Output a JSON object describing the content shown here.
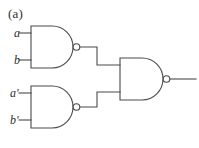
{
  "figure": {
    "panel_label": "(a)",
    "background_color": "#ffffff",
    "line_color": "#4a4a4a",
    "text_color": "#2f2c2a",
    "width": 199,
    "height": 148
  },
  "diagram": {
    "kind": "logic-circuit",
    "gates": [
      {
        "id": "nand-top",
        "type": "NAND",
        "label": "",
        "inputs": [
          "a",
          "b"
        ],
        "body": {
          "x": 31,
          "y": 26,
          "w": 42,
          "h": 42
        },
        "bubble": {
          "cx": 76.5,
          "cy": 47,
          "r": 3.5
        }
      },
      {
        "id": "nand-bottom",
        "type": "NAND",
        "label": "",
        "inputs": [
          "a'",
          "b'"
        ],
        "body": {
          "x": 31,
          "y": 86,
          "w": 42,
          "h": 42
        },
        "bubble": {
          "cx": 76.5,
          "cy": 107,
          "r": 3.5
        }
      },
      {
        "id": "nand-output",
        "type": "NAND",
        "label": "",
        "inputs": [
          "nand-top",
          "nand-bottom"
        ],
        "body": {
          "x": 120,
          "y": 58,
          "w": 43,
          "h": 42
        },
        "bubble": {
          "cx": 166.5,
          "cy": 79,
          "r": 3.5
        }
      }
    ],
    "signals": [
      {
        "id": "in-a",
        "name": "a",
        "x": 14,
        "y": 27
      },
      {
        "id": "in-b",
        "name": "b",
        "x": 14,
        "y": 54
      },
      {
        "id": "in-ap",
        "name": "a'",
        "x": 10,
        "y": 87
      },
      {
        "id": "in-bp",
        "name": "b'",
        "x": 10,
        "y": 114
      }
    ],
    "wires": [
      {
        "id": "wire-a",
        "points": "19,33 31,33"
      },
      {
        "id": "wire-b",
        "points": "19,60 31,60"
      },
      {
        "id": "wire-ap",
        "points": "19,93 31,93"
      },
      {
        "id": "wire-bp",
        "points": "19,120 31,120"
      },
      {
        "id": "wire-top-to-out",
        "points": "80,47 97,47 97,65 120,65"
      },
      {
        "id": "wire-bottom-to-out",
        "points": "80,107 97,107 97,92 120,92"
      },
      {
        "id": "wire-output",
        "points": "170,79 196,79"
      }
    ]
  }
}
